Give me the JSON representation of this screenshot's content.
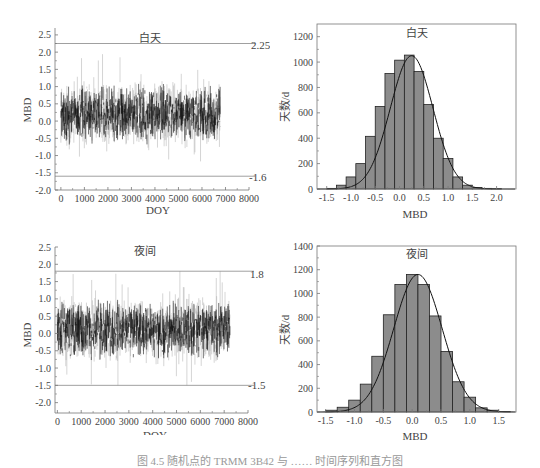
{
  "chart_data": [
    {
      "id": "ts_day",
      "type": "line",
      "title": "白天",
      "xlabel": "DOY",
      "ylabel": "MBD",
      "xlim": [
        -250,
        8000
      ],
      "ylim": [
        -2.0,
        2.7
      ],
      "xticks": [
        0,
        1000,
        2000,
        3000,
        4000,
        5000,
        6000,
        7000,
        8000
      ],
      "xtick_labels": [
        "0",
        "1000",
        "2000",
        "3000",
        "4000",
        "5000",
        "6000",
        "7000",
        "8000"
      ],
      "yticks": [
        2.5,
        2.0,
        1.5,
        1.0,
        0.5,
        0.0,
        -0.5,
        -1.0,
        -1.5,
        -2.0
      ],
      "ytick_labels": [
        "2.5",
        "2.0",
        "1.5",
        "1.0",
        "0.5",
        "0.0",
        "-0.5",
        "-1.0",
        "-1.5",
        "-2.0"
      ],
      "data_range_x": [
        0,
        6800
      ],
      "series_summary": {
        "mean": 0.2,
        "typical_band": [
          -1.0,
          1.3
        ],
        "max": 2.2,
        "min": -1.6,
        "n_points": 6800
      },
      "reference_lines": [
        {
          "y": 2.25,
          "label": "2.25"
        },
        {
          "y": -1.6,
          "label": "-1.6"
        }
      ],
      "grid": false
    },
    {
      "id": "hist_day",
      "type": "bar",
      "title": "白天",
      "xlabel": "MBD",
      "ylabel": "天数/d",
      "xlim": [
        -1.7,
        2.4
      ],
      "ylim": [
        0,
        1300
      ],
      "xticks": [
        -1.5,
        -1.0,
        -0.5,
        0.0,
        0.5,
        1.0,
        1.5,
        2.0
      ],
      "xtick_labels": [
        "-1.5",
        "-1.0",
        "-0.5",
        "0.0",
        "0.5",
        "1.0",
        "1.5",
        "2.0"
      ],
      "yticks": [
        0,
        200,
        400,
        600,
        800,
        1000,
        1200
      ],
      "ytick_labels": [
        "0",
        "200",
        "400",
        "600",
        "800",
        "1000",
        "1200"
      ],
      "bin_width": 0.2,
      "categories": [
        "-1.4",
        "-1.2",
        "-1.0",
        "-0.8",
        "-0.6",
        "-0.4",
        "-0.2",
        "0.0",
        "0.2",
        "0.4",
        "0.6",
        "0.8",
        "1.0",
        "1.2",
        "1.4",
        "1.6",
        "1.8",
        "2.0"
      ],
      "values": [
        5,
        30,
        95,
        200,
        415,
        650,
        910,
        1015,
        1055,
        925,
        665,
        400,
        240,
        95,
        30,
        12,
        5,
        3
      ],
      "fit_curve": {
        "type": "normal",
        "mean": 0.25,
        "peak": 1050,
        "sd": 0.44
      },
      "grid": false
    },
    {
      "id": "ts_night",
      "type": "line",
      "title": "夜间",
      "xlabel": "DOY",
      "ylabel": "MBD",
      "xlim": [
        -100,
        8000
      ],
      "ylim": [
        -2.3,
        2.5
      ],
      "xticks": [
        0,
        1000,
        2000,
        3000,
        4000,
        5000,
        6000,
        7000,
        8000
      ],
      "xtick_labels": [
        "0",
        "1000",
        "2000",
        "3000",
        "4000",
        "5000",
        "6000",
        "7000",
        "8000"
      ],
      "yticks": [
        2.5,
        2.0,
        1.5,
        1.0,
        0.5,
        0.0,
        -0.5,
        -1.0,
        -1.5,
        -2.0
      ],
      "ytick_labels": [
        "2.5",
        "2.0",
        "1.5",
        "1.0",
        "0.5",
        "0.0",
        "-0.5",
        "-1.0",
        "-1.5",
        "-2.0"
      ],
      "data_range_x": [
        0,
        7250
      ],
      "series_summary": {
        "mean": 0.1,
        "typical_band": [
          -1.0,
          1.1
        ],
        "max": 1.8,
        "min": -1.5,
        "n_points": 7250
      },
      "reference_lines": [
        {
          "y": 1.8,
          "label": "1.8"
        },
        {
          "y": -1.5,
          "label": "-1.5"
        }
      ],
      "grid": false
    },
    {
      "id": "hist_night",
      "type": "bar",
      "title": "夜间",
      "xlabel": "MBD",
      "ylabel": "天数/d",
      "xlim": [
        -1.65,
        1.8
      ],
      "ylim": [
        0,
        1400
      ],
      "xticks": [
        -1.5,
        -1.0,
        -0.5,
        0.0,
        0.5,
        1.0,
        1.5
      ],
      "xtick_labels": [
        "-1.5",
        "-1.0",
        "-0.5",
        "0.0",
        "0.5",
        "1.0",
        "1.5"
      ],
      "yticks": [
        0,
        200,
        400,
        600,
        800,
        1000,
        1200,
        1400
      ],
      "ytick_labels": [
        "0",
        "200",
        "400",
        "600",
        "800",
        "1000",
        "1200",
        "1400"
      ],
      "bin_width": 0.2,
      "categories": [
        "-1.4",
        "-1.2",
        "-1.0",
        "-0.8",
        "-0.6",
        "-0.4",
        "-0.2",
        "0.0",
        "0.2",
        "0.4",
        "0.6",
        "0.8",
        "1.0",
        "1.2",
        "1.4",
        "1.6"
      ],
      "values": [
        15,
        40,
        100,
        235,
        470,
        820,
        1075,
        1160,
        1075,
        810,
        510,
        255,
        125,
        35,
        15,
        5
      ],
      "fit_curve": {
        "type": "normal",
        "mean": 0.1,
        "peak": 1160,
        "sd": 0.42
      },
      "grid": false
    }
  ],
  "caption": "图 4.5  随机点的 TRMM 3B42 与 …… 时间序列和直方图"
}
